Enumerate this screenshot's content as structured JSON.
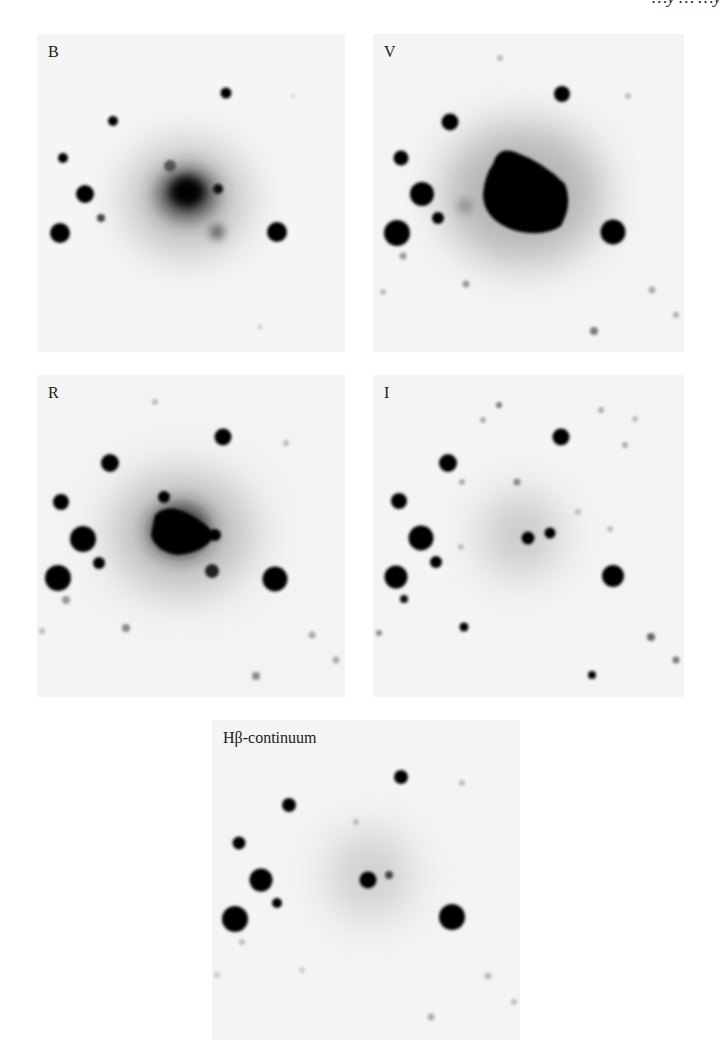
{
  "page": {
    "header_fragment": "…y … …y",
    "background": "#ffffff"
  },
  "figure": {
    "type": "astronomical image mosaic (negative grayscale)",
    "panels": [
      {
        "id": "B",
        "label": "B",
        "x": 37,
        "y": 34,
        "w": 308,
        "h": 318
      },
      {
        "id": "V",
        "label": "V",
        "x": 373,
        "y": 34,
        "w": 311,
        "h": 318
      },
      {
        "id": "R",
        "label": "R",
        "x": 37,
        "y": 375,
        "w": 308,
        "h": 322
      },
      {
        "id": "I",
        "label": "I",
        "x": 373,
        "y": 375,
        "w": 311,
        "h": 322
      },
      {
        "id": "Hb",
        "label": "Hβ-continuum",
        "x": 212,
        "y": 720,
        "w": 308,
        "h": 320
      }
    ]
  }
}
